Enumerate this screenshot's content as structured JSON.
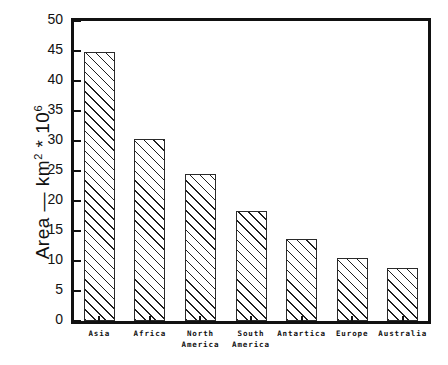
{
  "chart_data": {
    "type": "bar",
    "title": "",
    "xlabel": "",
    "ylabel": "Area -- km2 * 106",
    "ylabel_parts": {
      "prefix": "Area — km",
      "sup1": "2",
      "mid": " * 10",
      "sup2": "6"
    },
    "categories": [
      "Asia",
      "Africa",
      "North America",
      "South America",
      "Antartica",
      "Europe",
      "Australia"
    ],
    "category_lines": [
      [
        "Asia"
      ],
      [
        "Africa"
      ],
      [
        "North",
        "America"
      ],
      [
        "South",
        "America"
      ],
      [
        "Antartica"
      ],
      [
        "Europe"
      ],
      [
        "Australia"
      ]
    ],
    "values": [
      44.9,
      30.3,
      24.5,
      18.3,
      13.7,
      10.5,
      8.9
    ],
    "ylim": [
      0,
      50
    ],
    "ytick_values": [
      0,
      5,
      10,
      15,
      20,
      25,
      30,
      35,
      40,
      45,
      50
    ],
    "ytick_labels": [
      "0",
      "5",
      "10",
      "15",
      "20",
      "25",
      "30",
      "35",
      "40",
      "45",
      "50"
    ],
    "grid": false,
    "legend": null,
    "bar_fill": "hatched-diagonal",
    "colors": {
      "axis": "#111111",
      "bar_edge": "#2a2a2a",
      "hatch": "#1f1f1f",
      "background": "#ffffff"
    }
  }
}
